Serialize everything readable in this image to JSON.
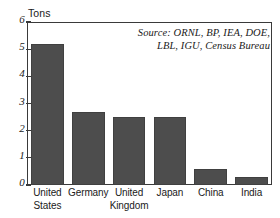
{
  "chart_data": {
    "type": "bar",
    "title": "",
    "xlabel": "",
    "ylabel": "Tons",
    "ylim": [
      0,
      6
    ],
    "yticks": [
      "0",
      "1",
      "2",
      "3",
      "4",
      "5",
      "6"
    ],
    "grid": false,
    "legend": null,
    "bar_color": "#4d4d4d",
    "categories": [
      "United States",
      "Germany",
      "United Kingdom",
      "Japan",
      "China",
      "India"
    ],
    "category_lines": [
      [
        "United",
        "States"
      ],
      [
        "Germany"
      ],
      [
        "United",
        "Kingdom"
      ],
      [
        "Japan"
      ],
      [
        "China"
      ],
      [
        "India"
      ]
    ],
    "values": [
      5.2,
      2.7,
      2.5,
      2.5,
      0.6,
      0.3
    ],
    "annotations": [
      "Source: ORNL, BP, IEA, DOE,",
      "LBL, IGU, Census Bureau"
    ]
  }
}
